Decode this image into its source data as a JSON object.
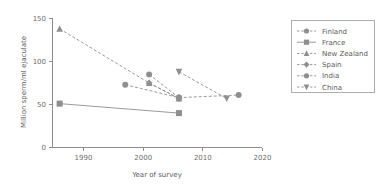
{
  "chart_data": {
    "type": "line",
    "title": "",
    "subtitle": "",
    "xlabel": "Year of survey",
    "ylabel": "Million sperm/ml ejaculate",
    "xlim": [
      1983,
      2021
    ],
    "ylim": [
      0,
      150
    ],
    "xticks": [
      "1990",
      "2000",
      "2010",
      "2020"
    ],
    "xtick_values": [
      1990,
      2000,
      2010,
      2020
    ],
    "yticks": [
      "0",
      "50",
      "100",
      "150"
    ],
    "ytick_values": [
      0,
      50,
      100,
      150
    ],
    "grid": false,
    "legend_position": "right-outside",
    "accent_color": "#8f8f8f",
    "axis_color": "#8c8c8c",
    "text_color": "#5a5a5a",
    "series": [
      {
        "name": "Finland",
        "marker": "circle",
        "linestyle": "dashed",
        "x": [
          2001,
          2006
        ],
        "values": [
          85,
          58
        ]
      },
      {
        "name": "France",
        "marker": "square",
        "linestyle": "solid",
        "x": [
          1986,
          2006
        ],
        "values": [
          51,
          40
        ]
      },
      {
        "name": "New Zealand",
        "marker": "triangle-up",
        "linestyle": "dashed",
        "x": [
          1986,
          2001,
          2006
        ],
        "values": [
          138,
          75,
          57
        ]
      },
      {
        "name": "Spain",
        "marker": "diamond",
        "linestyle": "dashed",
        "x": [
          2001,
          2006
        ],
        "values": [
          75,
          57
        ]
      },
      {
        "name": "India",
        "marker": "circle",
        "linestyle": "dashed",
        "x": [
          1997,
          2006,
          2016
        ],
        "values": [
          73,
          58,
          61
        ]
      },
      {
        "name": "China",
        "marker": "triangle-down",
        "linestyle": "dashed",
        "x": [
          2006,
          2014
        ],
        "values": [
          88,
          57
        ]
      }
    ]
  },
  "legend": {
    "items": [
      {
        "label": "Finland"
      },
      {
        "label": "France"
      },
      {
        "label": "New Zealand"
      },
      {
        "label": "Spain"
      },
      {
        "label": "India"
      },
      {
        "label": "China"
      }
    ]
  },
  "axes": {
    "x_title": "Year of survey",
    "y_title": "Million sperm/ml ejaculate"
  }
}
